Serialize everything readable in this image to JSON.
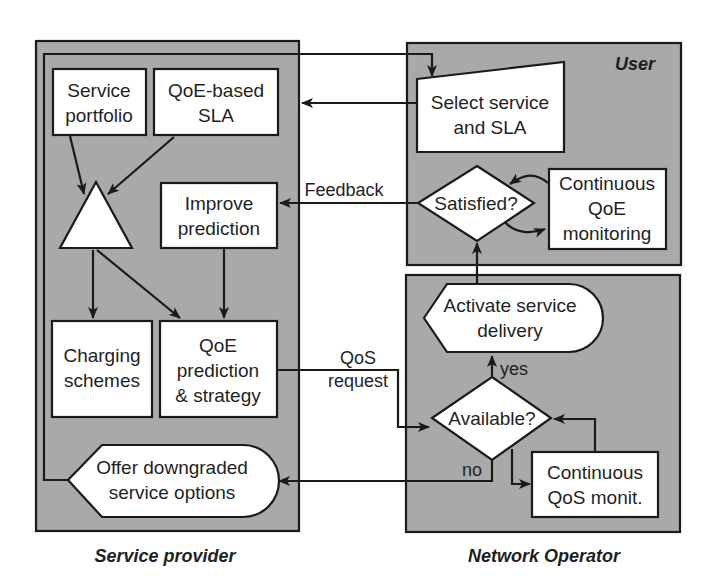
{
  "diagram": {
    "colors": {
      "frame_fill": "#a9a9a9",
      "box_fill": "#ffffff",
      "stroke": "#1a1a1a"
    },
    "regions": {
      "service_provider": "Service provider",
      "user": "User",
      "network_operator": "Network Operator"
    },
    "nodes": {
      "service_portfolio": [
        "Service",
        "portfolio"
      ],
      "qoe_sla": [
        "QoE-based",
        "SLA"
      ],
      "improve_prediction": [
        "Improve",
        "prediction"
      ],
      "charging_schemes": [
        "Charging",
        "schemes"
      ],
      "qoe_prediction": [
        "QoE",
        "prediction",
        "& strategy"
      ],
      "offer_downgraded": [
        "Offer downgraded",
        "service options"
      ],
      "select_service": [
        "Select service",
        "and SLA"
      ],
      "satisfied": [
        "Satisfied?"
      ],
      "continuous_qoe": [
        "Continuous",
        "QoE",
        "monitoring"
      ],
      "activate_delivery": [
        "Activate service",
        "delivery"
      ],
      "available": [
        "Available?"
      ],
      "continuous_qos": [
        "Continuous",
        "QoS monit."
      ]
    },
    "edge_labels": {
      "feedback": "Feedback",
      "qos_request": [
        "QoS",
        "request"
      ],
      "yes": "yes",
      "no": "no"
    }
  }
}
